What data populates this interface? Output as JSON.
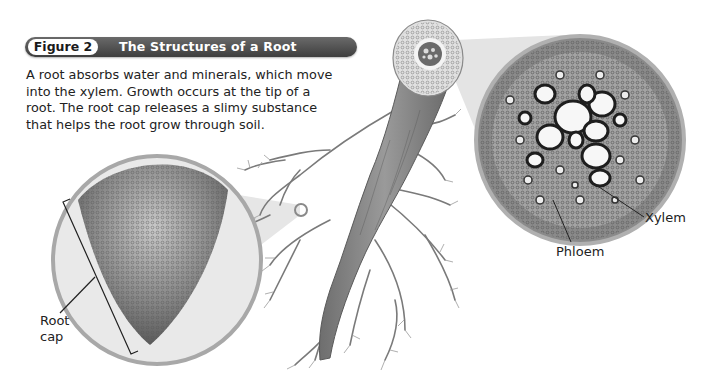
{
  "figure": {
    "number_label": "Figure 2",
    "title": "The Structures of a Root",
    "caption_lines": [
      "A root absorbs water and minerals, which move",
      "into the xylem. Growth occurs at the tip of a",
      "root. The root cap releases a slimy substance",
      "that helps the root grow through soil."
    ]
  },
  "labels": {
    "root_cap_line1": "Root",
    "root_cap_line2": "cap",
    "xylem": "Xylem",
    "phloem": "Phloem"
  },
  "colors": {
    "header_bar": "#4a4a4a",
    "header_text": "#ffffff",
    "magnifier_ring": "#a8a8a8",
    "body_text": "#222222"
  }
}
